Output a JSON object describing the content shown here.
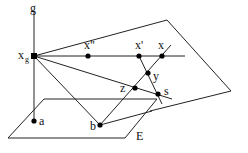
{
  "diagram": {
    "labels": {
      "g": "g",
      "xg_main": "x",
      "xg_sub": "g",
      "x_double_prime": "x\"",
      "x_prime": "x'",
      "x": "x",
      "y": "y",
      "z": "z",
      "s": "s",
      "a": "a",
      "b": "b",
      "E": "E"
    },
    "points": [
      {
        "name": "x_g",
        "x": 34,
        "y": 56
      },
      {
        "name": "x''",
        "x": 88,
        "y": 56
      },
      {
        "name": "x'",
        "x": 139,
        "y": 56
      },
      {
        "name": "x",
        "x": 162,
        "y": 56
      },
      {
        "name": "y",
        "x": 148,
        "y": 73
      },
      {
        "name": "z",
        "x": 135,
        "y": 88
      },
      {
        "name": "s",
        "x": 158,
        "y": 94
      },
      {
        "name": "a",
        "x": 34,
        "y": 121
      },
      {
        "name": "b",
        "x": 100,
        "y": 125
      }
    ]
  }
}
